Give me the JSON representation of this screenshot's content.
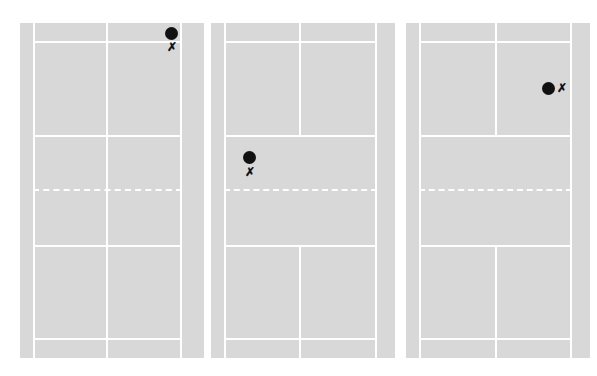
{
  "figure": {
    "colors": {
      "court": "#d8d8d8",
      "lines": "#ffffff",
      "marker": "#111111",
      "background": "#ffffff"
    },
    "marker_legend": {
      "dot": "shuttle/player position (filled circle)",
      "x": "target position"
    },
    "courts": [
      {
        "id": "court-1",
        "dot": "●",
        "x": "✗",
        "dot_position": "top-right back corner",
        "x_position": "below dot"
      },
      {
        "id": "court-2",
        "dot": "●",
        "x": "✗",
        "dot_position": "left mid, near short service line",
        "x_position": "below dot"
      },
      {
        "id": "court-3",
        "dot": "●",
        "x": "✗",
        "dot_position": "right service box, upper half",
        "x_position": "right of dot"
      }
    ]
  }
}
